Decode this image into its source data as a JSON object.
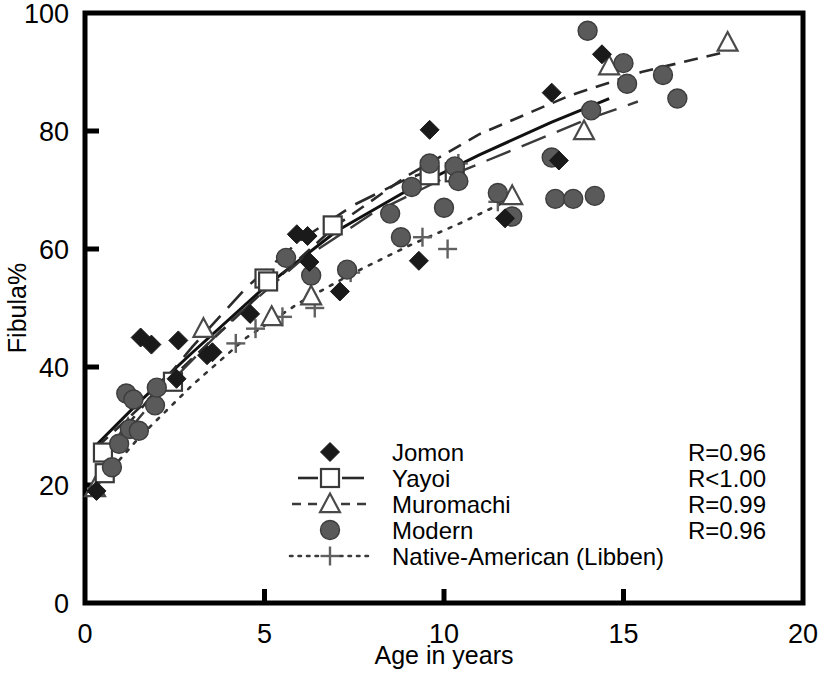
{
  "chart_data": {
    "type": "scatter",
    "title": "",
    "xlabel": "Age in years",
    "ylabel": "Fibula%",
    "xlim": [
      0,
      20
    ],
    "ylim": [
      0,
      100
    ],
    "xticks": [
      0,
      5,
      10,
      15,
      20
    ],
    "yticks": [
      0,
      20,
      40,
      60,
      80,
      100
    ],
    "grid": false,
    "legend_position": "inside-bottom-center",
    "series": [
      {
        "name": "Jomon",
        "marker": "filled-diamond",
        "line": "solid",
        "color": "#1a1a1a",
        "r_label": "R=0.96",
        "points": [
          [
            0.32,
            19.0
          ],
          [
            1.55,
            45.0
          ],
          [
            1.85,
            43.8
          ],
          [
            2.55,
            38.0
          ],
          [
            2.6,
            44.5
          ],
          [
            3.4,
            42.0
          ],
          [
            3.55,
            42.5
          ],
          [
            4.6,
            49.0
          ],
          [
            5.9,
            62.5
          ],
          [
            6.2,
            62.2
          ],
          [
            6.25,
            57.8
          ],
          [
            7.1,
            52.8
          ],
          [
            9.3,
            58.0
          ],
          [
            9.6,
            80.2
          ],
          [
            11.7,
            65.2
          ],
          [
            13.0,
            86.5
          ],
          [
            13.2,
            75.0
          ],
          [
            14.4,
            93.0
          ]
        ]
      },
      {
        "name": "Yayoi",
        "marker": "open-square",
        "line": "long-dash",
        "color": "#3a3a3a",
        "r_label": "R<1.00",
        "points": [
          [
            0.5,
            25.5
          ],
          [
            0.55,
            22.0
          ],
          [
            2.45,
            37.5
          ],
          [
            5.0,
            55.0
          ],
          [
            5.1,
            54.5
          ],
          [
            6.9,
            64.0
          ],
          [
            9.6,
            72.5
          ],
          [
            10.3,
            73.0
          ]
        ]
      },
      {
        "name": "Muromachi",
        "marker": "open-triangle",
        "line": "dashed",
        "color": "#4a4a4a",
        "r_label": "R=0.99",
        "points": [
          [
            0.28,
            19.5
          ],
          [
            1.2,
            29.5
          ],
          [
            3.3,
            46.5
          ],
          [
            5.2,
            48.5
          ],
          [
            6.3,
            52.0
          ],
          [
            11.9,
            69.0
          ],
          [
            13.9,
            80.0
          ],
          [
            14.6,
            91.0
          ],
          [
            17.9,
            95.0
          ]
        ]
      },
      {
        "name": "Modern",
        "marker": "filled-circle",
        "line": "none",
        "color": "#555555",
        "r_label": "R=0.96",
        "points": [
          [
            0.75,
            23.0
          ],
          [
            0.95,
            27.0
          ],
          [
            1.15,
            35.5
          ],
          [
            1.25,
            29.5
          ],
          [
            1.35,
            34.5
          ],
          [
            1.5,
            29.2
          ],
          [
            1.95,
            33.5
          ],
          [
            2.0,
            36.5
          ],
          [
            5.6,
            58.5
          ],
          [
            6.3,
            55.5
          ],
          [
            7.3,
            56.5
          ],
          [
            8.5,
            66.0
          ],
          [
            8.8,
            62.0
          ],
          [
            9.1,
            70.5
          ],
          [
            9.6,
            74.5
          ],
          [
            10.0,
            67.0
          ],
          [
            10.3,
            74.0
          ],
          [
            10.4,
            71.5
          ],
          [
            11.5,
            69.5
          ],
          [
            11.9,
            65.5
          ],
          [
            13.0,
            75.5
          ],
          [
            13.1,
            68.5
          ],
          [
            13.6,
            68.5
          ],
          [
            14.0,
            97.0
          ],
          [
            14.1,
            83.5
          ],
          [
            14.2,
            69.0
          ],
          [
            15.0,
            91.5
          ],
          [
            15.1,
            88.0
          ],
          [
            16.1,
            89.5
          ],
          [
            16.5,
            85.5
          ]
        ]
      },
      {
        "name": "Native-American (Libben)",
        "marker": "plus",
        "line": "dotted",
        "color": "#6a6a6a",
        "r_label": "R=0.96",
        "points": [
          [
            4.2,
            44.0
          ],
          [
            4.75,
            46.5
          ],
          [
            5.5,
            48.5
          ],
          [
            6.4,
            50.0
          ],
          [
            7.4,
            56.0
          ],
          [
            9.4,
            62.0
          ],
          [
            10.1,
            60.0
          ],
          [
            10.4,
            74.5
          ],
          [
            11.5,
            68.0
          ]
        ]
      }
    ],
    "trend_lines": [
      {
        "name": "Jomon-trend",
        "style": "solid",
        "color": "#111111",
        "width": 3.0,
        "path": [
          [
            0.35,
            27.0
          ],
          [
            1.5,
            34.0
          ],
          [
            3.0,
            42.5
          ],
          [
            5.0,
            53.5
          ],
          [
            7.0,
            63.0
          ],
          [
            9.0,
            70.0
          ],
          [
            11.0,
            76.0
          ],
          [
            13.0,
            81.5
          ],
          [
            14.6,
            85.5
          ]
        ]
      },
      {
        "name": "Yayoi-trend",
        "style": "long-dash",
        "color": "#2a2a2a",
        "width": 2.6,
        "path": [
          [
            0.4,
            24.5
          ],
          [
            1.5,
            32.5
          ],
          [
            3.0,
            43.5
          ],
          [
            4.5,
            53.5
          ],
          [
            6.0,
            61.5
          ],
          [
            7.5,
            67.5
          ],
          [
            9.0,
            72.0
          ],
          [
            10.4,
            74.8
          ]
        ]
      },
      {
        "name": "Muromachi-trend",
        "style": "dashed",
        "color": "#2a2a2a",
        "width": 2.6,
        "path": [
          [
            0.35,
            26.5
          ],
          [
            1.5,
            33.0
          ],
          [
            3.0,
            41.5
          ],
          [
            5.0,
            53.0
          ],
          [
            7.0,
            64.0
          ],
          [
            9.0,
            72.5
          ],
          [
            11.0,
            79.5
          ],
          [
            13.5,
            86.0
          ],
          [
            15.5,
            90.0
          ],
          [
            17.9,
            93.5
          ]
        ]
      },
      {
        "name": "Modern-trend",
        "style": "long-dash-alt",
        "color": "#3a3a3a",
        "width": 2.4,
        "path": [
          [
            0.5,
            24.0
          ],
          [
            2.0,
            35.0
          ],
          [
            4.0,
            47.5
          ],
          [
            6.0,
            58.0
          ],
          [
            8.0,
            66.0
          ],
          [
            10.0,
            72.0
          ],
          [
            12.0,
            77.0
          ],
          [
            14.0,
            82.0
          ],
          [
            15.4,
            85.0
          ]
        ]
      },
      {
        "name": "Native-American-trend",
        "style": "dotted",
        "color": "#333333",
        "width": 2.6,
        "path": [
          [
            0.35,
            20.0
          ],
          [
            1.5,
            28.0
          ],
          [
            3.0,
            37.0
          ],
          [
            4.5,
            45.0
          ],
          [
            6.0,
            51.0
          ],
          [
            7.5,
            56.0
          ],
          [
            9.0,
            60.5
          ],
          [
            10.5,
            64.5
          ],
          [
            11.7,
            68.0
          ]
        ]
      }
    ]
  },
  "axes": {
    "x_tick_labels": [
      "0",
      "5",
      "10",
      "15",
      "20"
    ],
    "y_tick_labels": [
      "0",
      "20",
      "40",
      "60",
      "80",
      "100"
    ],
    "x_title": "Age in years",
    "y_title": "Fibula%"
  },
  "legend": {
    "items": [
      {
        "label": "Jomon",
        "marker": "filled-diamond",
        "line": "none"
      },
      {
        "label": "Yayoi",
        "marker": "open-square",
        "line": "solid"
      },
      {
        "label": "Muromachi",
        "marker": "open-triangle",
        "line": "dashed"
      },
      {
        "label": "Modern",
        "marker": "filled-circle",
        "line": "none"
      },
      {
        "label": "Native-American (Libben)",
        "marker": "plus",
        "line": "dotted"
      }
    ]
  },
  "stats": {
    "items": [
      "R=0.96",
      "R<1.00",
      "R=0.99",
      "R=0.96"
    ]
  }
}
